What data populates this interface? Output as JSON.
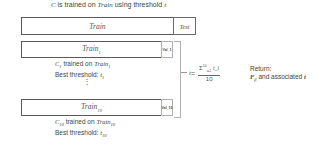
{
  "title": {
    "prefix": "C",
    "middle": " is trained on ",
    "train_word": "Train",
    "suffix": " using threshold ",
    "t": "t"
  },
  "top_split": {
    "train_label": "Train",
    "test_label": "Test"
  },
  "folds": [
    {
      "train_label": "Train",
      "train_sub": "1",
      "val_label": "Val_1",
      "desc_c": "C",
      "desc_c_sub": "1",
      "desc_mid": " trained on ",
      "desc_train": "Train",
      "desc_train_sub": "1",
      "best_label": "Best threshold: ",
      "best_t": "t",
      "best_t_sub": "1"
    },
    {
      "train_label": "Train",
      "train_sub": "10",
      "val_label": "Val_10",
      "desc_c": "C",
      "desc_c_sub": "10",
      "desc_mid": " trained on ",
      "desc_train": "Train",
      "desc_train_sub": "10",
      "best_label": "Best threshold: ",
      "best_t": "t",
      "best_t_sub": "10"
    }
  ],
  "ellipsis": "⋮",
  "formula": {
    "lhs": "t",
    "eq": " = ",
    "numerator": "Σ",
    "num_sup": "10",
    "num_sub": "i=1",
    "num_term": " t_i",
    "denominator": "10"
  },
  "return": {
    "line1": "Return:",
    "f": "F",
    "f_sub": "β",
    "line2_rest": " and associated ",
    "t": "t"
  }
}
